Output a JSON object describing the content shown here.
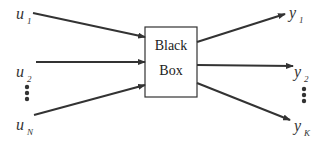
{
  "diagram": {
    "box": {
      "line1": "Black",
      "line2": "Box"
    },
    "inputs": [
      {
        "var": "u",
        "sub": "1"
      },
      {
        "var": "u",
        "sub": "2"
      },
      {
        "var": "u",
        "sub": "N"
      }
    ],
    "outputs": [
      {
        "var": "y",
        "sub": "1"
      },
      {
        "var": "y",
        "sub": "2"
      },
      {
        "var": "y",
        "sub": "K"
      }
    ],
    "ellipsis": "⋮"
  }
}
